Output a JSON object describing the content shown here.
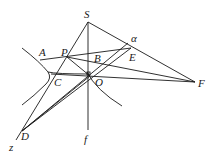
{
  "diagram": {
    "type": "projective-geometry-figure",
    "labels": {
      "S": "S",
      "alpha": "α",
      "A": "A",
      "P": "P",
      "B": "B",
      "E": "E",
      "C": "C",
      "O": "O",
      "F": "F",
      "D": "D",
      "z": "z",
      "f": "f"
    },
    "points": {
      "S": [
        88,
        22
      ],
      "alpha": [
        128,
        43
      ],
      "P": [
        67,
        57
      ],
      "E": [
        131,
        48
      ],
      "B": [
        96,
        62
      ],
      "C": [
        51,
        76
      ],
      "O": [
        89,
        74
      ],
      "F": [
        195,
        82
      ],
      "D": [
        22,
        131
      ],
      "f_end": [
        88,
        130
      ],
      "z_end": [
        16,
        140
      ]
    },
    "colors": {
      "stroke": "#1a1a1a",
      "background": "#ffffff"
    }
  }
}
